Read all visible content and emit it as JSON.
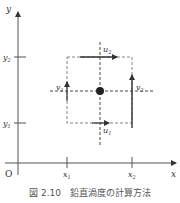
{
  "diagram": {
    "axes": {
      "x_label": "x",
      "y_label": "y",
      "origin_label": "O",
      "x_ticks": [
        "x1",
        "x2"
      ],
      "y_ticks": [
        "y1",
        "y2"
      ]
    },
    "vectors": {
      "u1": {
        "label": "u",
        "sub": "1"
      },
      "u2": {
        "label": "u",
        "sub": "2"
      },
      "v1": {
        "label": "v",
        "sub": "1"
      },
      "v2": {
        "label": "v",
        "sub": "2"
      }
    },
    "tick_labels": {
      "x1": {
        "base": "x",
        "sub": "1"
      },
      "x2": {
        "base": "x",
        "sub": "2"
      },
      "y1": {
        "base": "y",
        "sub": "1"
      },
      "y2": {
        "base": "y",
        "sub": "2"
      }
    },
    "colors": {
      "line": "#444444",
      "dashed": "#555555",
      "dot": "#222222"
    }
  },
  "caption": "図 2.10　鉛直渦度の計算方法"
}
